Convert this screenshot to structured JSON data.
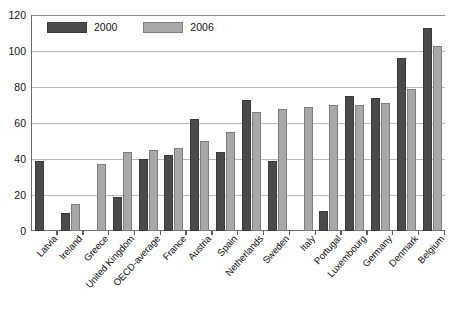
{
  "chart_data": {
    "type": "bar",
    "title": "",
    "xlabel": "",
    "ylabel": "",
    "ylim": [
      0,
      120
    ],
    "yticks": [
      0,
      20,
      40,
      60,
      80,
      100,
      120
    ],
    "grid": true,
    "legend_position": "top-left",
    "categories": [
      "Latvia",
      "Ireland",
      "Greece",
      "United Kingdom",
      "OECD-average",
      "France",
      "Austria",
      "Spain",
      "Netherlands",
      "Sweden",
      "Italy",
      "Portugal",
      "Luxembourg",
      "Germany",
      "Denmark",
      "Belgium"
    ],
    "series": [
      {
        "name": "2000",
        "color": "#4a4a4a",
        "values": [
          39,
          10,
          null,
          19,
          40,
          42,
          62,
          44,
          73,
          39,
          null,
          11,
          75,
          74,
          96,
          113
        ]
      },
      {
        "name": "2006",
        "color": "#a8a8a8",
        "values": [
          null,
          15,
          37,
          44,
          45,
          46,
          50,
          55,
          66,
          68,
          69,
          70,
          70,
          71,
          79,
          103
        ]
      }
    ]
  },
  "axis": {
    "y_tick_labels": [
      "0",
      "20",
      "40",
      "60",
      "80",
      "100",
      "120"
    ]
  },
  "legend": {
    "items": [
      {
        "label": "2000"
      },
      {
        "label": "2006"
      }
    ]
  }
}
